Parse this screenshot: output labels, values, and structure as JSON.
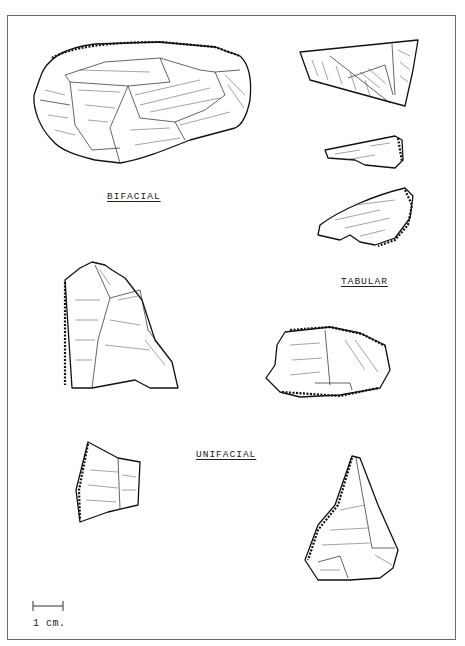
{
  "plate": {
    "labels": {
      "bifacial": "BIFACIAL",
      "tabular": "TABULAR",
      "unifacial": "UNIFACIAL"
    },
    "scale_bar": {
      "label": "1 cm.",
      "length_px": 30
    },
    "artifacts": [
      {
        "id": "bifacial-large",
        "group": "BIFACIAL"
      },
      {
        "id": "tabular-1",
        "group": "TABULAR"
      },
      {
        "id": "tabular-2",
        "group": "TABULAR"
      },
      {
        "id": "tabular-3",
        "group": "TABULAR"
      },
      {
        "id": "tabular-4",
        "group": "TABULAR"
      },
      {
        "id": "unifacial-1",
        "group": "UNIFACIAL"
      },
      {
        "id": "unifacial-2",
        "group": "UNIFACIAL"
      },
      {
        "id": "unifacial-3",
        "group": "UNIFACIAL"
      }
    ],
    "colors": {
      "ink": "#111111",
      "frame": "#6a6a6a",
      "paper": "#ffffff"
    }
  }
}
